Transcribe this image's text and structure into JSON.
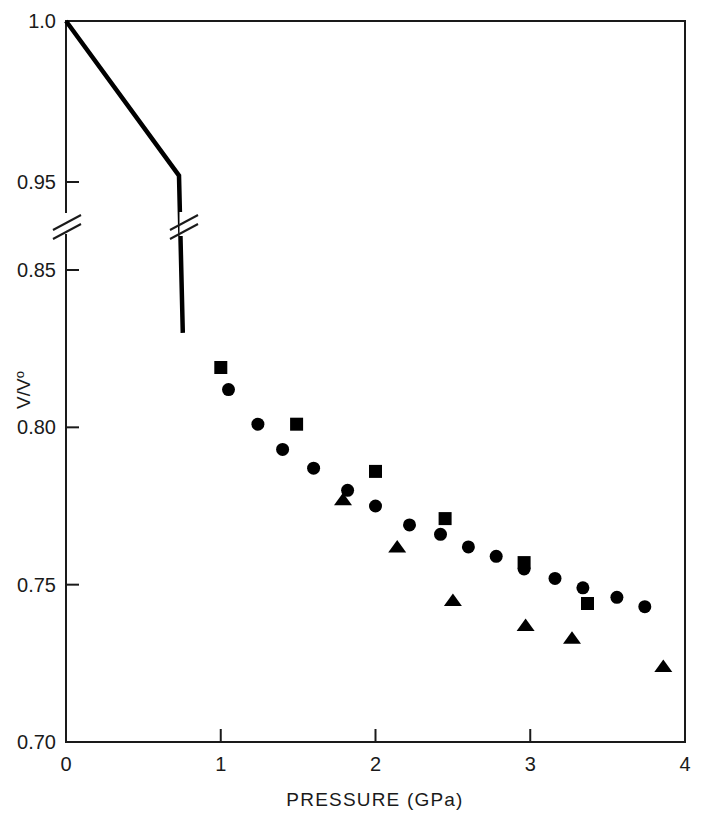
{
  "chart_data": {
    "type": "scatter",
    "title": "",
    "xlabel": "PRESSURE (GPa)",
    "ylabel": "V/V₀",
    "ylabel_parts": {
      "numerator": "V",
      "slash": "/",
      "denominator": "V",
      "subscript": "o"
    },
    "xlim": [
      0,
      4
    ],
    "ylim": [
      0.7,
      1.0
    ],
    "grid": false,
    "legend": "none",
    "x_ticks": [
      0,
      1,
      2,
      3,
      4
    ],
    "x_tick_labels": [
      "0",
      "1",
      "2",
      "3",
      "4"
    ],
    "y_ticks": [
      0.7,
      0.75,
      0.8,
      0.85,
      0.95,
      1.0
    ],
    "y_tick_labels": [
      "0.70",
      "0.75",
      "0.80",
      "0.85",
      "0.95",
      "1.0"
    ],
    "y_axis_break": {
      "present": true,
      "between": [
        0.85,
        0.95
      ],
      "style": "double-slash"
    },
    "annotations": [
      {
        "name": "axis-break-mark",
        "text": "//",
        "at_y": 0.9,
        "on": "y-axis"
      },
      {
        "name": "curve-break-mark",
        "text": "//",
        "at_y": 0.9,
        "on": "compression-curve"
      }
    ],
    "series": [
      {
        "name": "compression-curve",
        "marker": "none",
        "style": "solid-line",
        "color": "#000000",
        "points": [
          {
            "x": 0.0,
            "y": 1.0
          },
          {
            "x": 0.73,
            "y": 0.952
          },
          {
            "x": 0.755,
            "y": 0.83
          }
        ]
      },
      {
        "name": "squares",
        "marker": "square",
        "color": "#000000",
        "points": [
          {
            "x": 1.0,
            "y": 0.819
          },
          {
            "x": 1.49,
            "y": 0.801
          },
          {
            "x": 2.0,
            "y": 0.786
          },
          {
            "x": 2.45,
            "y": 0.771
          },
          {
            "x": 2.96,
            "y": 0.757
          },
          {
            "x": 3.37,
            "y": 0.744
          }
        ]
      },
      {
        "name": "circles",
        "marker": "circle",
        "color": "#000000",
        "points": [
          {
            "x": 1.05,
            "y": 0.812
          },
          {
            "x": 1.24,
            "y": 0.801
          },
          {
            "x": 1.4,
            "y": 0.793
          },
          {
            "x": 1.6,
            "y": 0.787
          },
          {
            "x": 1.82,
            "y": 0.78
          },
          {
            "x": 2.0,
            "y": 0.775
          },
          {
            "x": 2.22,
            "y": 0.769
          },
          {
            "x": 2.42,
            "y": 0.766
          },
          {
            "x": 2.6,
            "y": 0.762
          },
          {
            "x": 2.78,
            "y": 0.759
          },
          {
            "x": 2.96,
            "y": 0.755
          },
          {
            "x": 3.16,
            "y": 0.752
          },
          {
            "x": 3.34,
            "y": 0.749
          },
          {
            "x": 3.56,
            "y": 0.746
          },
          {
            "x": 3.74,
            "y": 0.743
          }
        ]
      },
      {
        "name": "triangles",
        "marker": "triangle",
        "color": "#000000",
        "points": [
          {
            "x": 1.79,
            "y": 0.777
          },
          {
            "x": 2.14,
            "y": 0.762
          },
          {
            "x": 2.5,
            "y": 0.745
          },
          {
            "x": 2.97,
            "y": 0.737
          },
          {
            "x": 3.27,
            "y": 0.733
          },
          {
            "x": 3.86,
            "y": 0.724
          }
        ]
      }
    ]
  },
  "figure": {
    "background": "#ffffff",
    "foreground": "#1a1a1a"
  }
}
